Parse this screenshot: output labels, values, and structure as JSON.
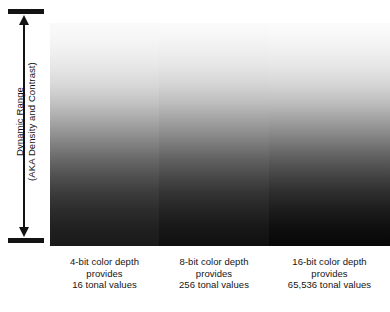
{
  "figure": {
    "axis": {
      "label_line1": "Dynamic Range",
      "label_line2": "(AKA Density and Contrast)",
      "arrow_style": "double-headed-vertical-with-end-caps",
      "color": "#131313"
    },
    "panels": [
      {
        "id": "panel-4bit",
        "gradient_top_color": "#fdfdfd",
        "gradient_bottom_color": "#181818",
        "direction": "white-to-black-top-to-bottom"
      },
      {
        "id": "panel-8bit",
        "gradient_top_color": "#fefefe",
        "gradient_bottom_color": "#0d0d0d",
        "direction": "white-to-black-top-to-bottom"
      },
      {
        "id": "panel-16bit",
        "gradient_top_color": "#ffffff",
        "gradient_bottom_color": "#050505",
        "direction": "white-to-black-top-to-bottom"
      }
    ],
    "captions": [
      {
        "line1": "4-bit color depth",
        "line2": "provides",
        "line3": "16 tonal values"
      },
      {
        "line1": "8-bit color depth",
        "line2": "provides",
        "line3": "256 tonal values"
      },
      {
        "line1": "16-bit color depth",
        "line2": "provides",
        "line3": "65,536 tonal values"
      }
    ]
  }
}
